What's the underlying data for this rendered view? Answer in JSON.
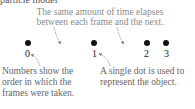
{
  "diagram": {
    "cut_text": "particle model",
    "top_caption": "The same amount of time elapses between each frame and the next.",
    "frames": [
      {
        "label": "0"
      },
      {
        "label": "1"
      },
      {
        "label": "2"
      },
      {
        "label": "3"
      }
    ],
    "bottom_left_caption": "Numbers show the order in which the frames were taken.",
    "bottom_right_caption": "A single dot is used to represent the object."
  }
}
